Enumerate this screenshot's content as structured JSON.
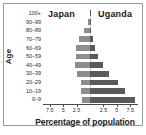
{
  "chart_data": {
    "type": "bar",
    "title": "",
    "subtitle": "",
    "orientation": "horizontal",
    "layout": "population-pyramid",
    "xlabel": "Percentage of population",
    "ylabel": "Age",
    "categories": [
      "0-9",
      "10-19",
      "20-29",
      "30-39",
      "40-49",
      "50-59",
      "60-69",
      "70-79",
      "80-89",
      "90-99",
      "100+"
    ],
    "xticks_left": [
      "7.5",
      "5",
      "2.5"
    ],
    "xticks_right": [
      "2.5",
      "5",
      "7.5"
    ],
    "xlim": [
      0,
      8.75
    ],
    "grid": false,
    "legend_position": "top-inline",
    "series": [
      {
        "name": "Japan",
        "side": "left",
        "color": "#8d8d8d",
        "values": [
          1.45,
          1.6,
          1.75,
          2.35,
          2.85,
          2.55,
          2.6,
          2.05,
          1.2,
          0.35,
          0.05
        ]
      },
      {
        "name": "Uganda",
        "side": "right",
        "color": "#5a5a5a",
        "values": [
          8.3,
          6.6,
          5.2,
          3.6,
          2.35,
          1.55,
          0.95,
          0.5,
          0.22,
          0.05,
          0.02
        ]
      }
    ]
  },
  "axis": {
    "y_title": "Age",
    "x_title": "Percentage of population"
  },
  "legend": {
    "left_label": "Japan",
    "right_label": "Uganda"
  },
  "colors": {
    "left_series": "#8d8d8d",
    "right_series": "#5a5a5a",
    "axis": "#4a4a4a",
    "text": "#1c1c1c",
    "plot_background": "#ffffff",
    "page_background": "#e8e8e8",
    "frame_border": "#9a9a9a"
  }
}
